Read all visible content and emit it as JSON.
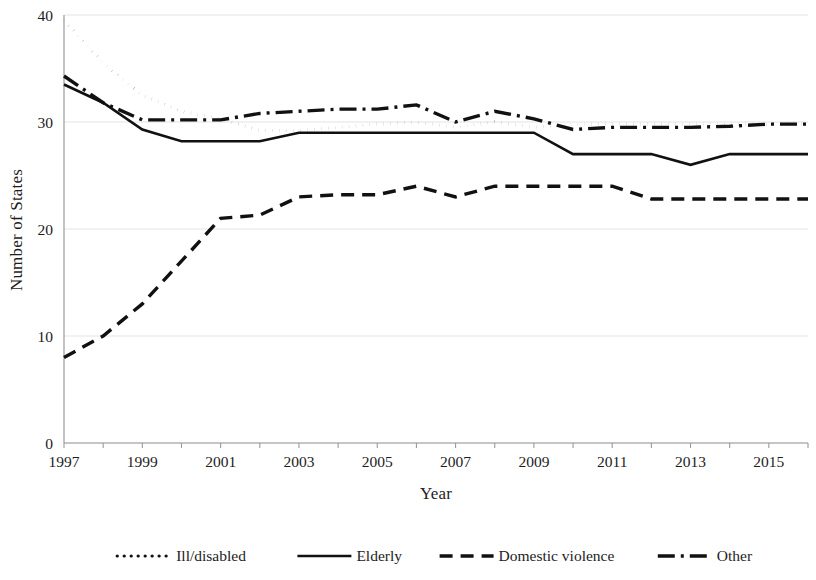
{
  "chart_data": {
    "type": "line",
    "title": "",
    "xlabel": "Year",
    "ylabel": "Number of States",
    "xlim": [
      1997,
      2016
    ],
    "ylim": [
      0,
      40
    ],
    "ytick_labels": [
      "0",
      "10",
      "20",
      "30",
      "40"
    ],
    "ytick_values": [
      0,
      10,
      20,
      30,
      40
    ],
    "xtick_labels": [
      "1997",
      "1999",
      "2001",
      "2003",
      "2005",
      "2007",
      "2009",
      "2011",
      "2013",
      "2015"
    ],
    "xtick_values": [
      1997,
      1999,
      2001,
      2003,
      2005,
      2007,
      2009,
      2011,
      2013,
      2015
    ],
    "grid": "horizontal",
    "legend_position": "bottom",
    "x": [
      1997,
      1998,
      1999,
      2000,
      2001,
      2002,
      2003,
      2004,
      2005,
      2006,
      2007,
      2008,
      2009,
      2010,
      2011,
      2012,
      2013,
      2014,
      2015,
      2016
    ],
    "series": [
      {
        "name": "Ill/disabled",
        "style": "dotted",
        "values": [
          39.5,
          35.5,
          32.5,
          31.0,
          30.3,
          29.2,
          29.2,
          29.5,
          29.8,
          30.0,
          29.5,
          30.0,
          29.5,
          29.8,
          29.8,
          29.8,
          29.8,
          29.8,
          29.8,
          29.8
        ]
      },
      {
        "name": "Elderly",
        "style": "solid",
        "values": [
          33.5,
          31.8,
          29.3,
          28.2,
          28.2,
          28.2,
          29.0,
          29.0,
          29.0,
          29.0,
          29.0,
          29.0,
          29.0,
          27.0,
          27.0,
          27.0,
          26.0,
          27.0,
          27.0,
          27.0
        ]
      },
      {
        "name": "Domestic violence",
        "style": "dashed",
        "values": [
          8.0,
          10.0,
          13.0,
          17.0,
          21.0,
          21.3,
          23.0,
          23.2,
          23.2,
          24.0,
          23.0,
          24.0,
          24.0,
          24.0,
          24.0,
          22.8,
          22.8,
          22.8,
          22.8,
          22.8
        ]
      },
      {
        "name": "Other",
        "style": "dashdot",
        "values": [
          34.3,
          31.8,
          30.2,
          30.2,
          30.2,
          30.8,
          31.0,
          31.2,
          31.2,
          31.6,
          30.0,
          31.0,
          30.3,
          29.3,
          29.5,
          29.5,
          29.5,
          29.6,
          29.8,
          29.8
        ]
      }
    ]
  },
  "legend": {
    "items": [
      {
        "label": "Ill/disabled"
      },
      {
        "label": "Elderly"
      },
      {
        "label": "Domestic violence"
      },
      {
        "label": "Other"
      }
    ]
  },
  "colors": {
    "line": "#111111",
    "grid": "#e3e3e3",
    "axis": "#9a9a9a",
    "text": "#1d1d1d"
  }
}
